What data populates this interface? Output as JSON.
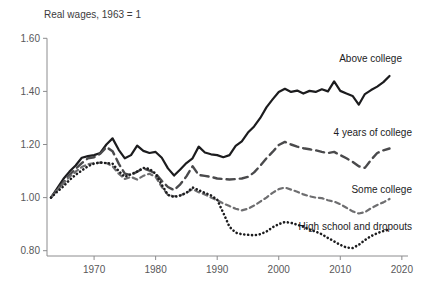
{
  "chart_data": {
    "type": "line",
    "title": "Real wages, 1963 = 1",
    "xlabel": "",
    "ylabel": "",
    "xlim": [
      1963,
      2021
    ],
    "ylim": [
      0.78,
      1.62
    ],
    "grid": false,
    "legend_position": "inline-right",
    "x_ticks": [
      "1970",
      "1980",
      "1990",
      "2000",
      "2010",
      "2020"
    ],
    "x_tick_values": [
      1970,
      1980,
      1990,
      2000,
      2010,
      2020
    ],
    "y_ticks": [
      "0.80",
      "1.00",
      "1.20",
      "1.40",
      "1.60"
    ],
    "y_tick_values": [
      0.8,
      1.0,
      1.2,
      1.4,
      1.6
    ],
    "x": [
      1963,
      1964,
      1965,
      1966,
      1967,
      1968,
      1969,
      1970,
      1971,
      1972,
      1973,
      1974,
      1975,
      1976,
      1977,
      1978,
      1979,
      1980,
      1981,
      1982,
      1983,
      1984,
      1985,
      1986,
      1987,
      1988,
      1989,
      1990,
      1991,
      1992,
      1993,
      1994,
      1995,
      1996,
      1997,
      1998,
      1999,
      2000,
      2001,
      2002,
      2003,
      2004,
      2005,
      2006,
      2007,
      2008,
      2009,
      2010,
      2011,
      2012,
      2013,
      2014,
      2015,
      2016,
      2017,
      2018
    ],
    "series": [
      {
        "name": "Above college",
        "label": "Above college",
        "color": "#1c1c1e",
        "style": "solid",
        "width": 2.2,
        "values": [
          1.0,
          1.035,
          1.07,
          1.098,
          1.121,
          1.15,
          1.156,
          1.16,
          1.168,
          1.2,
          1.223,
          1.18,
          1.148,
          1.16,
          1.196,
          1.176,
          1.168,
          1.172,
          1.15,
          1.11,
          1.083,
          1.106,
          1.13,
          1.148,
          1.192,
          1.17,
          1.163,
          1.16,
          1.152,
          1.16,
          1.195,
          1.212,
          1.245,
          1.268,
          1.3,
          1.34,
          1.37,
          1.398,
          1.41,
          1.398,
          1.403,
          1.392,
          1.402,
          1.398,
          1.408,
          1.4,
          1.438,
          1.402,
          1.392,
          1.383,
          1.35,
          1.39,
          1.405,
          1.418,
          1.435,
          1.458
        ]
      },
      {
        "name": "4 years of college",
        "label": "4 years of college",
        "color": "#4a4a4c",
        "style": "long-dash",
        "width": 2.4,
        "values": [
          1.0,
          1.03,
          1.058,
          1.086,
          1.108,
          1.13,
          1.148,
          1.152,
          1.165,
          1.19,
          1.175,
          1.128,
          1.09,
          1.085,
          1.098,
          1.11,
          1.102,
          1.09,
          1.063,
          1.04,
          1.028,
          1.05,
          1.08,
          1.118,
          1.085,
          1.082,
          1.078,
          1.072,
          1.07,
          1.068,
          1.07,
          1.072,
          1.078,
          1.095,
          1.12,
          1.148,
          1.172,
          1.198,
          1.21,
          1.2,
          1.192,
          1.186,
          1.182,
          1.178,
          1.172,
          1.168,
          1.172,
          1.16,
          1.148,
          1.135,
          1.118,
          1.112,
          1.142,
          1.168,
          1.178,
          1.185
        ]
      },
      {
        "name": "Some college",
        "label": "Some college",
        "color": "#6e6e70",
        "style": "short-dash",
        "width": 2.2,
        "values": [
          1.0,
          1.028,
          1.052,
          1.078,
          1.098,
          1.115,
          1.126,
          1.13,
          1.132,
          1.13,
          1.118,
          1.09,
          1.07,
          1.078,
          1.068,
          1.082,
          1.09,
          1.078,
          1.04,
          1.01,
          1.005,
          1.008,
          1.018,
          1.032,
          1.02,
          1.012,
          1.0,
          0.99,
          0.978,
          0.968,
          0.958,
          0.952,
          0.958,
          0.97,
          0.985,
          1.0,
          1.018,
          1.032,
          1.038,
          1.03,
          1.022,
          1.012,
          1.005,
          1.0,
          0.998,
          0.99,
          0.985,
          0.975,
          0.962,
          0.948,
          0.94,
          0.945,
          0.96,
          0.972,
          0.982,
          0.995
        ]
      },
      {
        "name": "High school and dropouts",
        "label": "High school and dropouts",
        "color": "#1c1c1e",
        "style": "dotted",
        "width": 2.6,
        "values": [
          1.0,
          1.022,
          1.042,
          1.066,
          1.086,
          1.102,
          1.118,
          1.128,
          1.132,
          1.13,
          1.128,
          1.1,
          1.078,
          1.088,
          1.098,
          1.112,
          1.108,
          1.09,
          1.048,
          1.01,
          1.002,
          1.008,
          1.018,
          1.038,
          1.028,
          1.018,
          1.008,
          0.992,
          0.942,
          0.89,
          0.868,
          0.862,
          0.86,
          0.858,
          0.862,
          0.872,
          0.888,
          0.9,
          0.908,
          0.905,
          0.898,
          0.89,
          0.88,
          0.872,
          0.862,
          0.848,
          0.835,
          0.822,
          0.812,
          0.81,
          0.822,
          0.84,
          0.855,
          0.866,
          0.874,
          0.88
        ]
      }
    ]
  }
}
